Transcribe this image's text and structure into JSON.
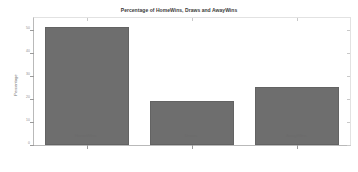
{
  "chart_data": {
    "type": "bar",
    "title": "Percentage of HomeWins, Draws and AwayWins",
    "xlabel": "",
    "ylabel": "Percentage",
    "categories": [
      "HomeWins",
      "Draws",
      "AwayWins"
    ],
    "values": [
      51,
      19,
      25
    ],
    "ylim": [
      0,
      55
    ],
    "yticks": [
      0,
      10,
      20,
      30,
      40,
      50
    ],
    "ytick_labels": [
      "0",
      "10",
      "20",
      "30",
      "40",
      "50"
    ],
    "grid": false,
    "legend": null,
    "bar_color": "#6e6e6e",
    "background_color": "#ffffff",
    "axis_color": "#b9b9b9"
  }
}
